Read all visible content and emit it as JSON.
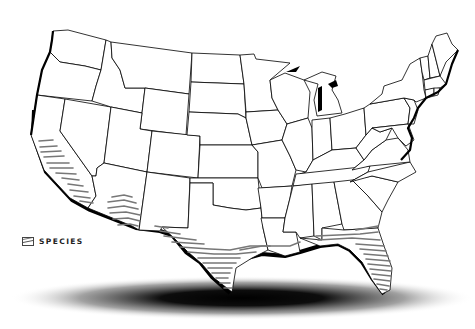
{
  "map": {
    "title": "",
    "region": "Contiguous United States",
    "style": "black outline states, hatched range overlay, drop shadow",
    "colors": {
      "background": "#ffffff",
      "state_fill": "#ffffff",
      "state_border": "#000000",
      "hatch": "#777777",
      "shadow": "#000000"
    },
    "hatched_regions": [
      "Southern California coast",
      "Southern Arizona",
      "Southern Texas / Gulf Coast",
      "Louisiana / Gulf Coast",
      "Florida and southern Georgia"
    ]
  },
  "legend": {
    "items": [
      {
        "icon": "hatch-swatch-icon",
        "label": "SPECIES"
      }
    ]
  }
}
